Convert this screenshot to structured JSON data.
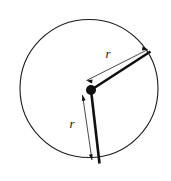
{
  "figure": {
    "name": "circle-with-two-radii",
    "background_color": "#ffffff",
    "stroke_color": "#1a1a1a",
    "canvas": {
      "width": 171,
      "height": 181
    }
  },
  "circle": {
    "name": "circle-outline",
    "center_x": 89,
    "center_y": 88.5,
    "radius": 69,
    "stroke_width": 1.1,
    "fill": "none"
  },
  "center_point": {
    "name": "center-dot",
    "x": 91,
    "y": 90,
    "radius": 5,
    "fill": "#111111"
  },
  "radii": [
    {
      "id": "upper-radius",
      "label": "r",
      "from_x": 91,
      "from_y": 90,
      "to_x": 150.5,
      "to_y": 51.5,
      "stroke_width": 2.6
    },
    {
      "id": "lower-radius",
      "label": "r",
      "from_x": 91,
      "from_y": 90,
      "to_x": 99.5,
      "to_y": 163.5,
      "stroke_width": 2.6
    }
  ],
  "dimension_lines": [
    {
      "id": "upper-dimension",
      "label": "r",
      "from_x": 86.5,
      "from_y": 80.5,
      "to_x": 148,
      "to_y": 49.5,
      "stroke_width": 0.8,
      "label_x": 108,
      "label_y": 55
    },
    {
      "id": "lower-dimension",
      "label": "r",
      "from_x": 82.5,
      "from_y": 95,
      "to_x": 92,
      "to_y": 160,
      "stroke_width": 0.8,
      "label_x": 72,
      "label_y": 125
    }
  ],
  "labels": {
    "upper_radius_label": "r",
    "lower_radius_label": "r"
  }
}
